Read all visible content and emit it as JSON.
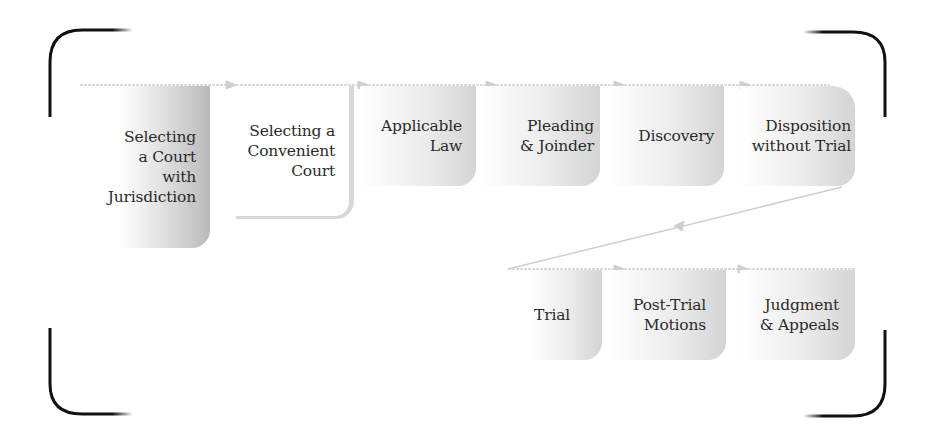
{
  "diagram": {
    "type": "process-flow",
    "colors": {
      "bracket": "#111111",
      "flow_line": "#cfcfcf",
      "box_shade": "#cfcfcf",
      "text": "#2b2b2b"
    },
    "rows": [
      {
        "name": "upper-row",
        "steps": [
          {
            "id": "selecting-court-jurisdiction",
            "label": "Selecting\na Court\nwith\nJurisdiction"
          },
          {
            "id": "selecting-convenient-court",
            "label": "Selecting a\nConvenient\nCourt"
          },
          {
            "id": "applicable-law",
            "label": "Applicable\nLaw"
          },
          {
            "id": "pleading-joinder",
            "label": "Pleading\n& Joinder"
          },
          {
            "id": "discovery",
            "label": "Discovery"
          },
          {
            "id": "disposition-without-trial",
            "label": "Disposition\nwithout Trial"
          }
        ]
      },
      {
        "name": "lower-row",
        "steps": [
          {
            "id": "trial",
            "label": "Trial"
          },
          {
            "id": "post-trial-motions",
            "label": "Post-Trial\nMotions"
          },
          {
            "id": "judgment-appeals",
            "label": "Judgment\n& Appeals"
          }
        ]
      }
    ]
  }
}
